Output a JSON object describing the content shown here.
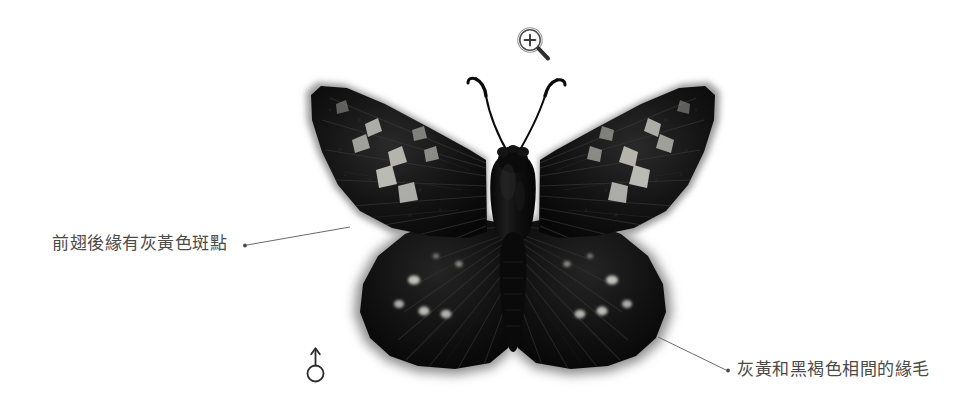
{
  "page": {
    "background_color": "#ffffff",
    "width": 964,
    "height": 418
  },
  "subject": {
    "name": "butterfly-specimen",
    "description": "dark skipper butterfly specimen, dorsal view, wings spread",
    "body_color": "#0d0d0d",
    "wing_color": "#111111",
    "spot_color": "#c9c9c4",
    "fringe_color": "#9a9a9a"
  },
  "annotations": [
    {
      "id": "forewing-spots",
      "text": "前翅後緣有灰黃色斑點",
      "text_color": "#4a4a4a",
      "dot": {
        "x": 244,
        "y": 245
      },
      "target": {
        "x": 350,
        "y": 227
      }
    },
    {
      "id": "fringe",
      "text": "灰黃和黑褐色相間的緣毛",
      "text_color": "#4a4a4a",
      "dot": {
        "x": 729,
        "y": 370
      },
      "target": {
        "x": 657,
        "y": 337
      }
    }
  ],
  "sex_symbol": {
    "name": "male-symbol",
    "glyph": "♂",
    "color": "#2b2b2b"
  },
  "zoom_icon": {
    "name": "magnifier-zoom-in-icon",
    "glyph": "+",
    "color": "#4d4d4d",
    "tooltip": ""
  }
}
